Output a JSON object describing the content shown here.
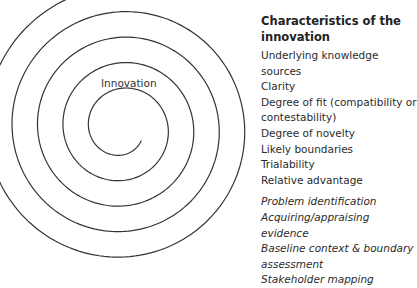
{
  "diagram": {
    "spiral_label": "Innovation",
    "spiral": {
      "center_x": 122,
      "center_y": 128,
      "turn_spacing": 25.5,
      "stroke": "#333333",
      "stroke_width": 1.2
    }
  },
  "panel": {
    "title_line1": "Characteristics of the",
    "title_line2": "innovation",
    "characteristics": [
      "Underlying knowledge",
      "sources",
      "Clarity",
      "Degree of fit (compatibility or",
      "contestability)",
      "Degree of novelty",
      "Likely boundaries",
      "Trialability",
      "Relative advantage"
    ],
    "process_steps": [
      "Problem identification",
      "Acquiring/appraising",
      "evidence",
      "Baseline context & boundary",
      "assessment",
      "Stakeholder mapping"
    ]
  }
}
